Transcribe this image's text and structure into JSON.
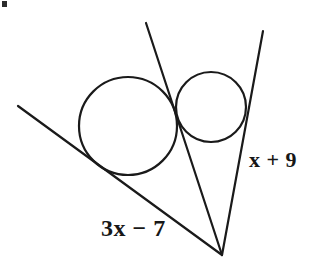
{
  "figure": {
    "background_color": "#ffffff",
    "stroke_color": "#1a1a1a",
    "stroke_width": 2,
    "width": 329,
    "height": 261,
    "vertex": {
      "x": 222,
      "y": 255
    },
    "circles": [
      {
        "name": "large-circle",
        "cx": 128,
        "cy": 126,
        "r": 49
      },
      {
        "name": "small-circle",
        "cx": 211,
        "cy": 107,
        "r": 35
      }
    ],
    "lines": [
      {
        "name": "left-tangent-line",
        "x1": 18,
        "y1": 106,
        "x2": 222,
        "y2": 255
      },
      {
        "name": "middle-line",
        "x1": 146,
        "y1": 23,
        "x2": 222,
        "y2": 255
      },
      {
        "name": "right-tangent-line",
        "x1": 263,
        "y1": 31,
        "x2": 222,
        "y2": 255
      }
    ],
    "labels": {
      "left_line": "3x − 7",
      "right_line": "x + 9"
    },
    "artifact": {
      "name": "scan-speck",
      "color": "#2b2b2b"
    }
  }
}
